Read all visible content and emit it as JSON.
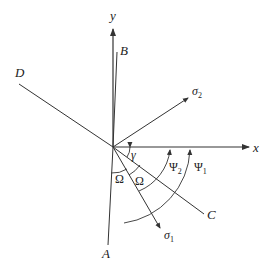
{
  "diagram": {
    "type": "coordinate-axes-with-stress-directions",
    "axes": {
      "x_label": "x",
      "y_label": "y"
    },
    "lines": {
      "A": "A",
      "B": "B",
      "C": "C",
      "D": "D"
    },
    "stress_vectors": {
      "sigma1": {
        "base": "σ",
        "sub": "1"
      },
      "sigma2": {
        "base": "σ",
        "sub": "2"
      }
    },
    "angles": {
      "gamma": "γ",
      "omega_left": "Ω",
      "omega_right": "Ω",
      "psi1": {
        "base": "Ψ",
        "sub": "1"
      },
      "psi2": {
        "base": "Ψ",
        "sub": "2"
      }
    },
    "colors": {
      "stroke": "#333333",
      "text": "#222222",
      "background": "#ffffff"
    }
  }
}
